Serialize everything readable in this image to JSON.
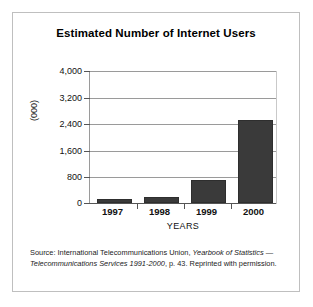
{
  "figure": {
    "title": "Estimated Number of Internet Users",
    "caption_prefix": "Source: International Telecommunications Union, ",
    "caption_italic_1": "Yearbook of Statistics",
    "caption_mid": " — ",
    "caption_italic_2": "Telecommunications Services 1991-2000",
    "caption_suffix": ", p. 43. Reprinted with permission."
  },
  "chart_data": {
    "type": "bar",
    "title": "Estimated Number of Internet Users",
    "categories": [
      "1997",
      "1998",
      "1999",
      "2000"
    ],
    "values": [
      120,
      180,
      680,
      2500
    ],
    "xlabel": "YEARS",
    "ylabel": "(000)",
    "ylim": [
      0,
      4000
    ],
    "yticks": [
      0,
      800,
      1600,
      2400,
      3200,
      4000
    ],
    "ytick_labels": [
      "0",
      "800",
      "1,600",
      "2,400",
      "3,200",
      "4,000"
    ],
    "grid": true,
    "legend": false,
    "bar_color": "#3a3a3a",
    "grid_color": "#9a9a9a"
  }
}
